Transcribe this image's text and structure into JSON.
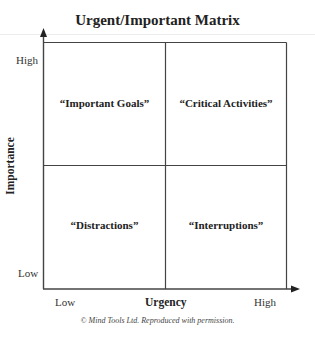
{
  "title": "Urgent/Important Matrix",
  "axes": {
    "y": {
      "label": "Importance",
      "high": "High",
      "low": "Low"
    },
    "x": {
      "label": "Urgency",
      "low": "Low",
      "high": "High"
    }
  },
  "quadrants": {
    "top_left": "“Important Goals”",
    "top_right": "“Critical Activities”",
    "bottom_left": "“Distractions”",
    "bottom_right": "“Interruptions”"
  },
  "credit": "© Mind Tools Ltd.  Reproduced with permission.",
  "colors": {
    "line": "#444444",
    "text": "#222222",
    "rule": "#ececec"
  }
}
